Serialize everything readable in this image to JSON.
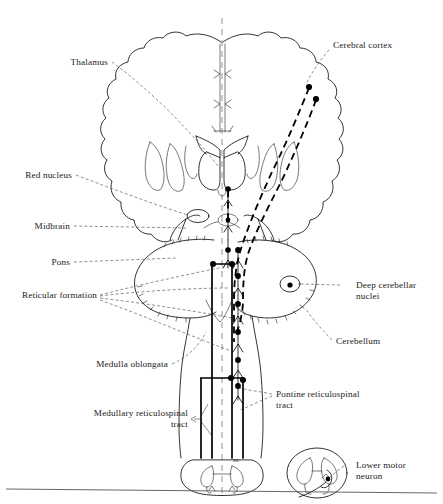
{
  "figure": {
    "type": "anatomical-diagram",
    "title": ""
  },
  "labels": {
    "thalamus": "Thalamus",
    "red_nucleus": "Red nucleus",
    "midbrain": "Midbrain",
    "pons": "Pons",
    "reticular_formation": "Reticular formation",
    "medulla_oblongata": "Medulla oblongata",
    "medullary_tract_line1": "Medullary reticulospinal",
    "medullary_tract_line2": "tract",
    "cerebral_cortex": "Cerebral cortex",
    "deep_cerebellar_line1": "Deep cerebellar",
    "deep_cerebellar_line2": "nuclei",
    "cerebellum": "Cerebellum",
    "pontine_tract_line1": "Pontine reticulospinal",
    "pontine_tract_line2": "tract",
    "lower_motor_line1": "Lower motor",
    "lower_motor_line2": "neuron",
    "spinal_marker": "me"
  },
  "structures": {
    "cerebrum": "cerebral-hemispheres-coronal",
    "basal_ganglia": "basal-ganglia",
    "thalamus_body": "thalamus",
    "red_nucleus_body": "red-nucleus-oval",
    "midbrain_body": "midbrain",
    "pons_body": "pons",
    "cerebellum_body": "cerebellum",
    "medulla_body": "medulla-oblongata",
    "spinal_cord_main": "spinal-cord-cross-section",
    "spinal_cord_inset": "spinal-cord-inset-cross-section",
    "deep_nuclei": "deep-cerebellar-nucleus-oval"
  },
  "pathways": {
    "pontine": {
      "name": "pontine-reticulospinal-tract",
      "style": "solid"
    },
    "medullary": {
      "name": "medullary-reticulospinal-tract",
      "style": "solid"
    },
    "corticoreticular": {
      "name": "corticoreticular-fibers",
      "style": "dashed"
    },
    "midline": {
      "name": "midline-axis",
      "style": "dashed"
    }
  },
  "colors": {
    "ink": "#111111",
    "paper": "#ffffff",
    "leader": "#333333",
    "midline": "#777777"
  }
}
